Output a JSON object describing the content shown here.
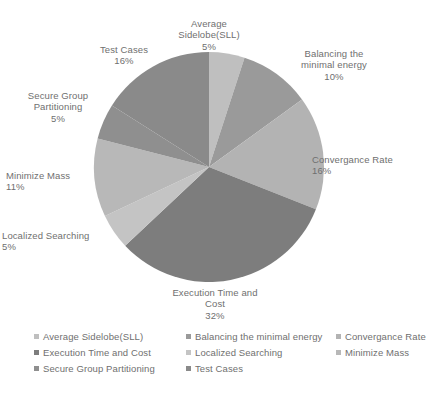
{
  "chart_data": {
    "type": "pie",
    "title": "",
    "subtitle": "",
    "xlabel": "",
    "ylabel": "",
    "legend_position": "bottom",
    "grid": false,
    "start_angle_deg": 0,
    "direction": "clockwise",
    "units": "percent",
    "total": 100,
    "categories": [
      "Average Sidelobe(SLL)",
      "Balancing the minimal energy",
      "Convergance Rate",
      "Execution Time and Cost",
      "Localized Searching",
      "Minimize Mass",
      "Secure Group Partitioning",
      "Test Cases"
    ],
    "values": [
      5,
      10,
      16,
      32,
      5,
      11,
      5,
      16
    ],
    "colors": [
      "#bfbfbf",
      "#9a9a9a",
      "#b3b3b3",
      "#7d7d7d",
      "#c4c4c4",
      "#b8b8b8",
      "#8f8f8f",
      "#8a8a8a"
    ],
    "slices": [
      {
        "label": "Average Sidelobe(SLL)",
        "value": 5,
        "pct_text": "5%",
        "color": "#bfbfbf"
      },
      {
        "label": "Balancing the minimal energy",
        "value": 10,
        "pct_text": "10%",
        "color": "#9a9a9a"
      },
      {
        "label": "Convergance Rate",
        "value": 16,
        "pct_text": "16%",
        "color": "#b3b3b3"
      },
      {
        "label": "Execution Time and Cost",
        "value": 32,
        "pct_text": "32%",
        "color": "#7d7d7d"
      },
      {
        "label": "Localized Searching",
        "value": 5,
        "pct_text": "5%",
        "color": "#c4c4c4"
      },
      {
        "label": "Minimize Mass",
        "value": 11,
        "pct_text": "11%",
        "color": "#b8b8b8"
      },
      {
        "label": "Secure Group Partitioning",
        "value": 5,
        "pct_text": "5%",
        "color": "#8f8f8f"
      },
      {
        "label": "Test Cases",
        "value": 16,
        "pct_text": "16%",
        "color": "#8a8a8a"
      }
    ]
  },
  "callouts": {
    "average_sidelobe": {
      "name": "Average\nSidelobe(SLL)",
      "pct": "5%"
    },
    "balancing_energy": {
      "name": "Balancing the\nminimal energy",
      "pct": "10%"
    },
    "convergance_rate": {
      "name": "Convergance Rate",
      "pct": "16%"
    },
    "execution_time_cost": {
      "name": "Execution Time and\nCost",
      "pct": "32%"
    },
    "localized_searching": {
      "name": "Localized Searching",
      "pct": "5%"
    },
    "minimize_mass": {
      "name": "Minimize Mass",
      "pct": "11%"
    },
    "secure_group": {
      "name": "Secure Group\nPartitioning",
      "pct": "5%"
    },
    "test_cases": {
      "name": "Test Cases",
      "pct": "16%"
    }
  },
  "legend": {
    "rows": [
      [
        {
          "label": "Average Sidelobe(SLL)",
          "color": "#bfbfbf"
        },
        {
          "label": "Balancing the minimal energy",
          "color": "#9a9a9a"
        },
        {
          "label": "Convergance Rate",
          "color": "#b3b3b3"
        }
      ],
      [
        {
          "label": "Execution Time and Cost",
          "color": "#7d7d7d"
        },
        {
          "label": "Localized Searching",
          "color": "#c4c4c4"
        },
        {
          "label": "Minimize Mass",
          "color": "#b8b8b8"
        }
      ],
      [
        {
          "label": "Secure Group Partitioning",
          "color": "#8f8f8f"
        },
        {
          "label": "Test Cases",
          "color": "#8a8a8a"
        }
      ]
    ]
  },
  "geometry": {
    "center_x": 209,
    "center_y": 167,
    "radius": 115
  }
}
